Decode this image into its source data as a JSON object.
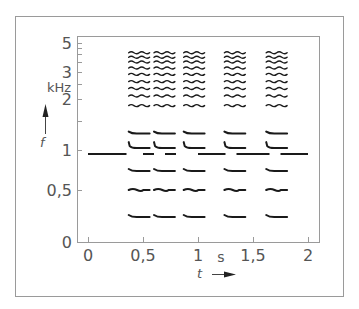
{
  "chart_data": {
    "type": "scatter",
    "title": "",
    "xlabel": "t",
    "x_unit": "s",
    "ylabel": "f",
    "y_unit": "kHz",
    "xlim": [
      0,
      2
    ],
    "ylim": [
      0,
      5
    ],
    "x_ticks": [
      "0",
      "0,5",
      "1",
      "1,5",
      "2"
    ],
    "x_tick_values": [
      0,
      0.5,
      1,
      1.5,
      2
    ],
    "y_ticks": [
      "0",
      "0,5",
      "1",
      "2",
      "3",
      "5"
    ],
    "y_tick_values": [
      0,
      0.5,
      1,
      2,
      3,
      5
    ],
    "y_minor_ticks": [
      1.5,
      2.5,
      3.5,
      4,
      4.5
    ],
    "grid": false,
    "reference_tone": {
      "frequency_khz": 0.95,
      "segments_s": [
        [
          0,
          0.35
        ],
        [
          0.5,
          0.6
        ],
        [
          0.7,
          0.8
        ],
        [
          1.0,
          1.25
        ],
        [
          1.35,
          1.65
        ],
        [
          1.75,
          2.0
        ]
      ]
    },
    "bursts": [
      {
        "start_s": 0.37,
        "end_s": 0.56
      },
      {
        "start_s": 0.6,
        "end_s": 0.79
      },
      {
        "start_s": 0.87,
        "end_s": 1.06
      },
      {
        "start_s": 1.24,
        "end_s": 1.43
      },
      {
        "start_s": 1.62,
        "end_s": 1.81
      }
    ],
    "partials_khz": [
      0.25,
      0.5,
      0.75,
      1.05,
      1.3,
      1.85,
      2.1,
      2.35,
      2.6,
      2.9,
      3.2,
      3.5,
      3.8,
      4.1
    ]
  },
  "axes": {
    "y_unit_label": "kHz",
    "y_symbol": "f",
    "x_unit_label": "s",
    "x_symbol": "t"
  }
}
